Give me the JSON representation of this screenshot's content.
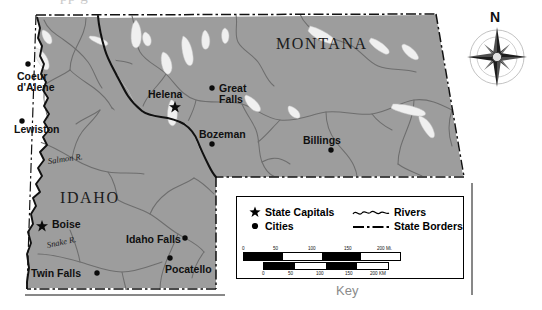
{
  "page": {
    "top_cut_text": "pp g",
    "key_caption": "Key",
    "compass_label": "N"
  },
  "map": {
    "states": [
      {
        "name": "MONTANA",
        "x": 276,
        "y": 36
      },
      {
        "name": "IDAHO",
        "x": 60,
        "y": 190
      }
    ],
    "capitals": [
      {
        "name": "Helena",
        "label_x": 150,
        "label_y": 90,
        "marker_x": 175,
        "marker_y": 107
      },
      {
        "name": "Boise",
        "label_x": 52,
        "label_y": 222,
        "marker_x": 42,
        "marker_y": 226
      }
    ],
    "cities": [
      {
        "name": "Coeur\nd'Alene",
        "label_x": 17,
        "label_y": 72,
        "marker_x": 28,
        "marker_y": 64
      },
      {
        "name": "Lewiston",
        "label_x": 14,
        "label_y": 125,
        "marker_x": 22,
        "marker_y": 121
      },
      {
        "name": "Great\nFalls",
        "label_x": 220,
        "label_y": 86,
        "marker_x": 212,
        "marker_y": 88
      },
      {
        "name": "Bozeman",
        "label_x": 200,
        "label_y": 131,
        "marker_x": 212,
        "marker_y": 144
      },
      {
        "name": "Billings",
        "label_x": 304,
        "label_y": 137,
        "marker_x": 331,
        "marker_y": 150
      },
      {
        "name": "Idaho Falls",
        "label_x": 126,
        "label_y": 236,
        "marker_x": 185,
        "marker_y": 238
      },
      {
        "name": "Pocatello",
        "label_x": 165,
        "label_y": 267,
        "marker_x": 170,
        "marker_y": 258
      },
      {
        "name": "Twin Falls",
        "label_x": 31,
        "label_y": 271,
        "marker_x": 97,
        "marker_y": 273
      }
    ],
    "rivers": [
      {
        "name": "Salmon R.",
        "x": 48,
        "y": 160,
        "rotate": -8
      },
      {
        "name": "Snake R.",
        "x": 47,
        "y": 244,
        "rotate": -12
      }
    ],
    "colors": {
      "land": "#9d9d9d",
      "water_lake": "#f2f2f2",
      "river_line": "#6e6e6e",
      "border": "#111111",
      "background": "#ffffff",
      "key_caption": "#8b8b8b"
    }
  },
  "legend": {
    "title": "Key",
    "symbols": [
      {
        "icon": "star-icon",
        "label": "State Capitals"
      },
      {
        "icon": "dot-icon",
        "label": "Cities"
      },
      {
        "icon": "wavy-line-icon",
        "label": "Rivers"
      },
      {
        "icon": "dashdot-line-icon",
        "label": "State Borders"
      }
    ],
    "scale_miles": {
      "ticks": [
        "0",
        "50",
        "100",
        "150",
        "200"
      ],
      "unit": "Mi.",
      "unit_label": "200 Mi."
    },
    "scale_km": {
      "ticks": [
        "0",
        "50",
        "100",
        "150",
        "200"
      ],
      "unit": "KM",
      "unit_label": "200 KM"
    }
  }
}
